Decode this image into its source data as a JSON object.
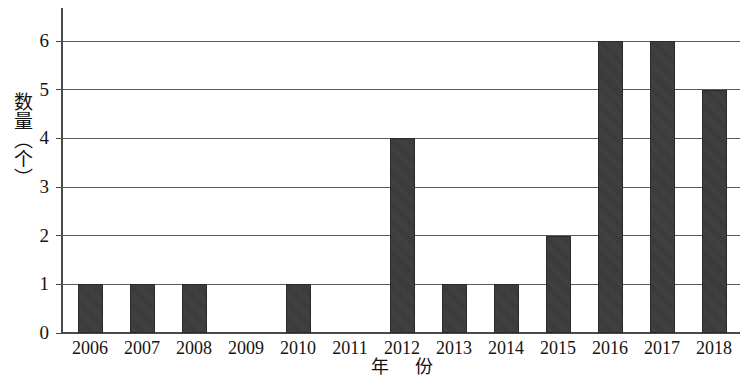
{
  "chart_data": {
    "type": "bar",
    "title": "",
    "xlabel": "年 份",
    "ylabel": "数量（个）",
    "categories": [
      "2006",
      "2007",
      "2008",
      "2009",
      "2010",
      "2011",
      "2012",
      "2013",
      "2014",
      "2015",
      "2016",
      "2017",
      "2018"
    ],
    "values": [
      1,
      1,
      1,
      0,
      1,
      0,
      4,
      1,
      1,
      2,
      6,
      6,
      5
    ],
    "ylim": [
      0,
      6
    ],
    "yticks": [
      "0",
      "1",
      "2",
      "3",
      "4",
      "5",
      "6"
    ],
    "grid": true,
    "legend": null,
    "bar_color": "#3b3b3b",
    "axis_color": "#4a4a4a"
  }
}
